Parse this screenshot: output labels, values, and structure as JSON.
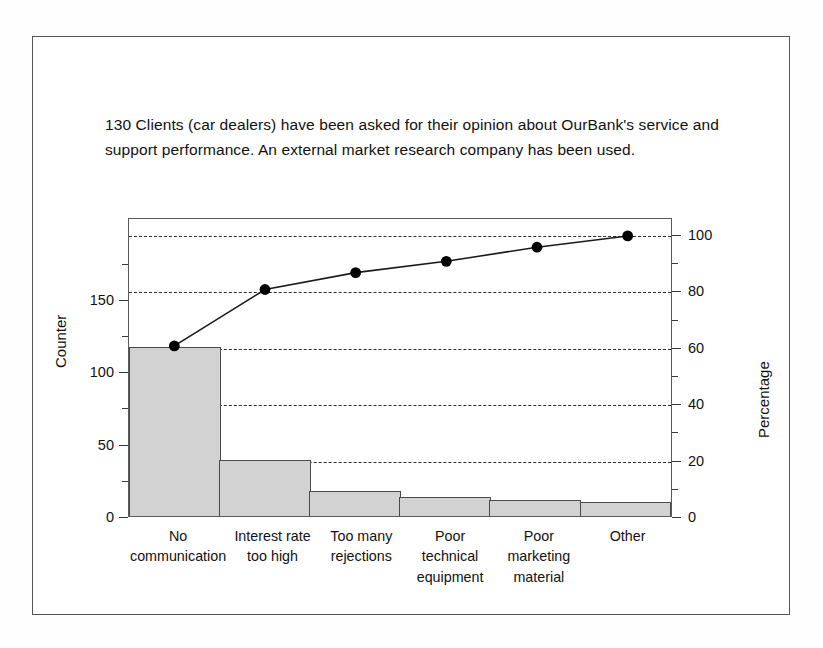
{
  "caption": {
    "text": "130 Clients (car dealers) have been asked for their opinion about OurBank's service and support performance. An external market research company has been used."
  },
  "chart_data": {
    "type": "bar",
    "title": "",
    "subtitle": "",
    "categories": [
      "No communication",
      "Interest rate too high",
      "Too many rejections",
      "Poor technical equipment",
      "Poor marketing material",
      "Other"
    ],
    "category_lines": [
      [
        "No",
        "communication"
      ],
      [
        "Interest rate",
        "too high"
      ],
      [
        "Too many",
        "rejections"
      ],
      [
        "Poor",
        "technical",
        "equipment"
      ],
      [
        "Poor",
        "marketing",
        "material"
      ],
      [
        "Other"
      ]
    ],
    "series": [
      {
        "name": "Counter",
        "type": "bar",
        "axis": "left",
        "values": [
          117,
          39,
          17,
          13,
          11,
          10
        ]
      },
      {
        "name": "Cumulative Percentage",
        "type": "line",
        "axis": "right",
        "values": [
          61,
          81,
          87,
          91,
          96,
          100
        ]
      }
    ],
    "xlabel": "",
    "ylabel": "Counter",
    "y2label": "Percentage",
    "ylim": [
      0,
      206.5
    ],
    "y2lim": [
      0,
      106
    ],
    "yticks": [
      0,
      50,
      100,
      150
    ],
    "yticks_minor": [
      25,
      75,
      125,
      175
    ],
    "y2ticks": [
      0,
      20,
      40,
      60,
      80,
      100
    ],
    "ytick_labels": [
      "0",
      "50",
      "100",
      "150"
    ],
    "y2tick_labels": [
      "0",
      "20",
      "40",
      "60",
      "80",
      "100"
    ],
    "grid": true,
    "gridlines_at_percent": [
      0,
      20,
      40,
      60,
      80,
      100
    ],
    "legend": "none",
    "total": 130,
    "colors": {
      "bar_fill": "#d2d2d2",
      "bar_border": "#4a4a4a",
      "line": "#1a1a1a",
      "marker": "#000000",
      "grid": "#2c2c2c",
      "axis": "#5a5a5a",
      "frame": "#555555"
    }
  }
}
